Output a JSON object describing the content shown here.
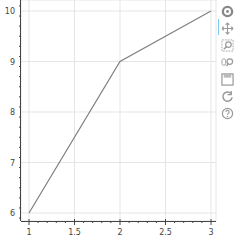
{
  "chart_data": {
    "type": "line",
    "title": "",
    "xlabel": "",
    "ylabel": "",
    "x": [
      1,
      2,
      3
    ],
    "series": [
      {
        "name": "line",
        "values": [
          6,
          9,
          10
        ],
        "color": "#808080"
      }
    ],
    "xlim": [
      0.9,
      3.05
    ],
    "ylim": [
      5.85,
      10.15
    ],
    "x_ticks": [
      "1",
      "1.5",
      "2",
      "2.5",
      "3"
    ],
    "y_ticks": [
      "6",
      "7",
      "8",
      "9",
      "10"
    ],
    "grid": true,
    "legend": null
  },
  "toolbar": {
    "tools": [
      {
        "name": "bokeh-logo",
        "label": "Bokeh"
      },
      {
        "name": "pan-tool",
        "label": "Pan"
      },
      {
        "name": "box-zoom-tool",
        "label": "Box Zoom"
      },
      {
        "name": "wheel-zoom-tool",
        "label": "Wheel Zoom"
      },
      {
        "name": "save-tool",
        "label": "Save"
      },
      {
        "name": "reset-tool",
        "label": "Reset"
      },
      {
        "name": "help-tool",
        "label": "Help"
      }
    ]
  },
  "colors": {
    "line": "#808080",
    "grid": "#e5e5e5",
    "axis": "#444444",
    "tool": "#bbbbbb"
  }
}
